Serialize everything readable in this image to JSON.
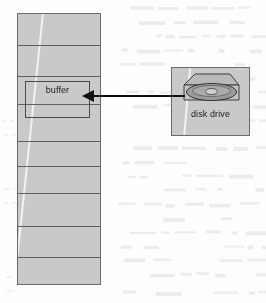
{
  "figure": {
    "title": "",
    "background_color": "#fdfdfd",
    "fill_color": "#c9c9c9",
    "line_color": "#5f5f5f",
    "arrow_color": "#101010"
  },
  "memory": {
    "name": "memory-column",
    "segment_count": 9,
    "divider_offsets_px": [
      31,
      62,
      90,
      127,
      152,
      179,
      212,
      243
    ]
  },
  "buffer": {
    "label": "buffer"
  },
  "drive": {
    "label": "disk drive",
    "icon_name": "disk-drive-icon"
  },
  "arrow": {
    "name": "data-transfer-arrow",
    "direction": "right-to-left",
    "from": "disk drive",
    "to": "buffer",
    "label": ""
  }
}
